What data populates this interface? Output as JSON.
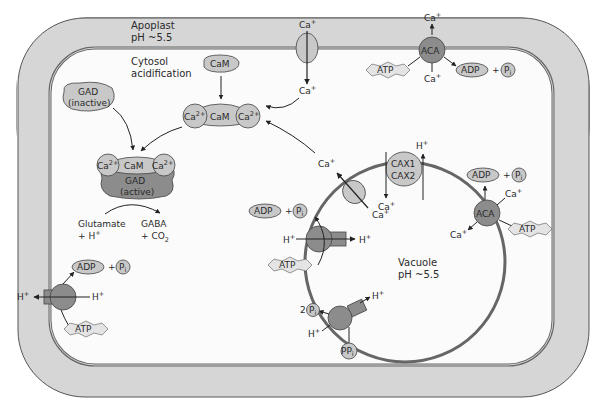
{
  "diagram": {
    "regions": {
      "apoplast": {
        "line1": "Apoplast",
        "line2": "pH ~5.5"
      },
      "cytosol": {
        "line1": "Cytosol",
        "line2": "acidification"
      },
      "vacuole": {
        "line1": "Vacuole",
        "line2": "pH ~5.5"
      }
    },
    "molecules": {
      "cam": "CaM",
      "ca2": "Ca",
      "ca2_charge": "2+",
      "ca": "Ca",
      "ca_charge": "+",
      "h": "H",
      "h_charge": "+",
      "gad_inactive_1": "GAD",
      "gad_inactive_2": "(inactive)",
      "gad_active_1": "GAD",
      "gad_active_2": "(active)",
      "substrate_1": "Glutamate",
      "substrate_2": "+ H",
      "product_1": "GABA",
      "product_2": "+ CO",
      "product_2_sub": "2",
      "atp": "ATP",
      "adp": "ADP",
      "plus": "+",
      "pi": "P",
      "pi_sub": "i",
      "ppi": "PP",
      "ppi_sub": "i",
      "two": "2"
    },
    "transporters": {
      "aca": "ACA",
      "cax1": "CAX1",
      "cax2": "CAX2"
    },
    "colors": {
      "cell_wall": "#d4d4d4",
      "cytosol": "#fbfbfb",
      "protein_light": "#c8c8c8",
      "protein_dark": "#8c8c8c",
      "membrane_line": "#555555",
      "outline": "#444444"
    }
  }
}
